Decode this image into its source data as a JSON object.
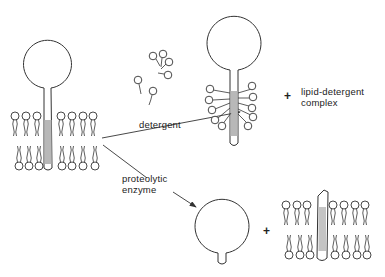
{
  "diagram": {
    "title": "",
    "labels": {
      "detergent": "detergent",
      "proteolytic_line1": "proteolytic",
      "proteolytic_line2": "enzyme",
      "complex_line1": "lipid-detergent",
      "complex_line2": "complex",
      "plus_top": "+",
      "plus_bottom": "+"
    },
    "nodes": [
      {
        "id": "membrane-protein-in-bilayer",
        "description": "globular-headed membrane protein anchored by hydrophobic stalk in lipid bilayer"
      },
      {
        "id": "detergent-molecules",
        "description": "free detergent molecules"
      },
      {
        "id": "solubilized-protein",
        "description": "protein with stalk surrounded by detergent micelle"
      },
      {
        "id": "lipid-detergent-complex",
        "description": "lipid-detergent complex"
      },
      {
        "id": "released-head",
        "description": "cleaved globular head with short stub"
      },
      {
        "id": "bilayer-with-stalk",
        "description": "lipid bilayer retaining hydrophobic stalk fragment"
      }
    ],
    "edges": [
      {
        "from": "membrane-protein-in-bilayer",
        "to": "solubilized-protein",
        "label": "detergent"
      },
      {
        "from": "membrane-protein-in-bilayer",
        "to": "released-head",
        "label": "proteolytic enzyme"
      }
    ],
    "colors": {
      "line": "#333333",
      "shade": "#b8b8b8"
    }
  }
}
